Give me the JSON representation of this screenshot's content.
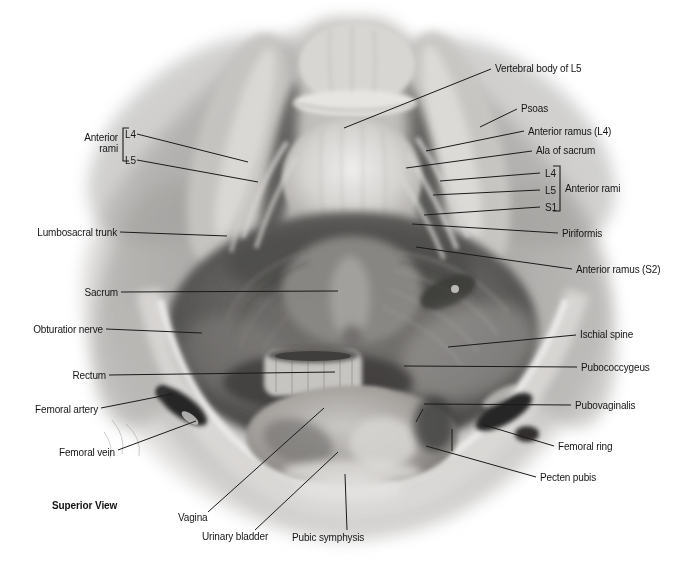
{
  "figure": {
    "caption": "Superior View",
    "background": "#ffffff",
    "ink": "#1a1a1a"
  },
  "labels": [
    {
      "id": "vertebral-body-of-l5",
      "text": "Vertebral body of L5",
      "x": 495,
      "y": 68,
      "align": "left",
      "line": [
        [
          344,
          128
        ],
        [
          491,
          69
        ]
      ]
    },
    {
      "id": "psoas",
      "text": "Psoas",
      "x": 521,
      "y": 108,
      "align": "left",
      "line": [
        [
          480,
          127
        ],
        [
          517,
          109
        ]
      ]
    },
    {
      "id": "anterior-ramus-l4",
      "text": "Anterior ramus (L4)",
      "x": 528,
      "y": 131,
      "align": "left",
      "line": [
        [
          426,
          151
        ],
        [
          524,
          131
        ]
      ]
    },
    {
      "id": "ala-of-sacrum",
      "text": "Ala of sacrum",
      "x": 536,
      "y": 150,
      "align": "left",
      "line": [
        [
          406,
          168
        ],
        [
          532,
          151
        ]
      ]
    },
    {
      "id": "l4-right",
      "text": "L4",
      "x": 545,
      "y": 173,
      "align": "left",
      "line": [
        [
          440,
          181
        ],
        [
          540,
          173
        ]
      ]
    },
    {
      "id": "l5-right",
      "text": "L5",
      "x": 545,
      "y": 190,
      "align": "left",
      "line": [
        [
          433,
          195
        ],
        [
          540,
          190
        ]
      ]
    },
    {
      "id": "s1-right",
      "text": "S1",
      "x": 545,
      "y": 207,
      "align": "left",
      "line": [
        [
          424,
          215
        ],
        [
          540,
          207
        ]
      ]
    },
    {
      "id": "anterior-rami-right",
      "text": "Anterior rami",
      "x": 565,
      "y": 188,
      "align": "left",
      "line": null
    },
    {
      "id": "piriformis",
      "text": "Piriformis",
      "x": 562,
      "y": 233,
      "align": "left",
      "line": [
        [
          412,
          224
        ],
        [
          558,
          233
        ]
      ]
    },
    {
      "id": "anterior-ramus-s2",
      "text": "Anterior ramus (S2)",
      "x": 576,
      "y": 269,
      "align": "left",
      "line": [
        [
          416,
          247
        ],
        [
          572,
          269
        ]
      ]
    },
    {
      "id": "ischial-spine",
      "text": "Ischial spine",
      "x": 580,
      "y": 334,
      "align": "left",
      "line": [
        [
          448,
          347
        ],
        [
          576,
          335
        ]
      ]
    },
    {
      "id": "pubococcygeus",
      "text": "Pubococcygeus",
      "x": 581,
      "y": 367,
      "align": "left",
      "line": [
        [
          404,
          366
        ],
        [
          577,
          367
        ]
      ]
    },
    {
      "id": "pubovaginalis",
      "text": "Pubovaginalis",
      "x": 575,
      "y": 405,
      "align": "left",
      "line": [
        [
          424,
          404
        ],
        [
          571,
          405
        ]
      ]
    },
    {
      "id": "femoral-ring",
      "text": "Femoral ring",
      "x": 558,
      "y": 446,
      "align": "left",
      "line": [
        [
          484,
          425
        ],
        [
          554,
          446
        ]
      ]
    },
    {
      "id": "pecten-pubis",
      "text": "Pecten pubis",
      "x": 540,
      "y": 477,
      "align": "left",
      "line": [
        [
          426,
          446
        ],
        [
          536,
          477
        ]
      ]
    },
    {
      "id": "anterior-rami-left",
      "text": "Anterior rami",
      "x": 118,
      "y": 143,
      "align": "right",
      "multiline": true,
      "width": 50,
      "line": null
    },
    {
      "id": "l4-left",
      "text": "L4",
      "x": 125,
      "y": 134,
      "align": "left",
      "line": [
        [
          137,
          134
        ],
        [
          248,
          162
        ]
      ]
    },
    {
      "id": "l5-left",
      "text": "L5",
      "x": 125,
      "y": 160,
      "align": "left",
      "line": [
        [
          137,
          160
        ],
        [
          258,
          182
        ]
      ]
    },
    {
      "id": "lumbosacral-trunk",
      "text": "Lumbosacral trunk",
      "x": 117,
      "y": 232,
      "align": "right",
      "line": [
        [
          120,
          232
        ],
        [
          227,
          236
        ]
      ]
    },
    {
      "id": "sacrum",
      "text": "Sacrum",
      "x": 118,
      "y": 292,
      "align": "right",
      "line": [
        [
          121,
          292
        ],
        [
          338,
          291
        ]
      ]
    },
    {
      "id": "obturatior-nerve",
      "text": "Obturatior nerve",
      "x": 103,
      "y": 329,
      "align": "right",
      "line": [
        [
          106,
          329
        ],
        [
          202,
          333
        ]
      ]
    },
    {
      "id": "rectum",
      "text": "Rectum",
      "x": 106,
      "y": 375,
      "align": "right",
      "line": [
        [
          109,
          375
        ],
        [
          335,
          372
        ]
      ]
    },
    {
      "id": "femoral-artery",
      "text": "Femoral artery",
      "x": 98,
      "y": 409,
      "align": "right",
      "line": [
        [
          101,
          408
        ],
        [
          172,
          394
        ]
      ]
    },
    {
      "id": "femoral-vein",
      "text": "Femoral vein",
      "x": 115,
      "y": 452,
      "align": "right",
      "line": [
        [
          118,
          450
        ],
        [
          196,
          421
        ]
      ]
    },
    {
      "id": "vagina",
      "text": "Vagina",
      "x": 178,
      "y": 517,
      "align": "left",
      "line": [
        [
          208,
          512
        ],
        [
          324,
          408
        ]
      ]
    },
    {
      "id": "urinary-bladder",
      "text": "Urinary bladder",
      "x": 202,
      "y": 536,
      "align": "left",
      "line": [
        [
          255,
          530
        ],
        [
          338,
          452
        ]
      ]
    },
    {
      "id": "pubic-symphysis",
      "text": "Pubic symphysis",
      "x": 292,
      "y": 537,
      "align": "left",
      "line": [
        [
          347,
          530
        ],
        [
          345,
          474
        ]
      ]
    }
  ],
  "brackets": [
    {
      "id": "anterior-rami-left-bracket",
      "points": [
        [
          129,
          128
        ],
        [
          123,
          128
        ],
        [
          123,
          161
        ],
        [
          129,
          161
        ]
      ]
    },
    {
      "id": "anterior-rami-right-bracket",
      "points": [
        [
          553,
          166
        ],
        [
          560,
          166
        ],
        [
          560,
          211
        ],
        [
          553,
          211
        ]
      ]
    }
  ],
  "extra_lines": [
    {
      "id": "pubovaginalis-pointer-2",
      "from": [
        423,
        409
      ],
      "to": [
        416,
        422
      ]
    },
    {
      "id": "pecten-pubis-pin",
      "from": [
        452,
        429
      ],
      "to": [
        452,
        451
      ]
    }
  ]
}
